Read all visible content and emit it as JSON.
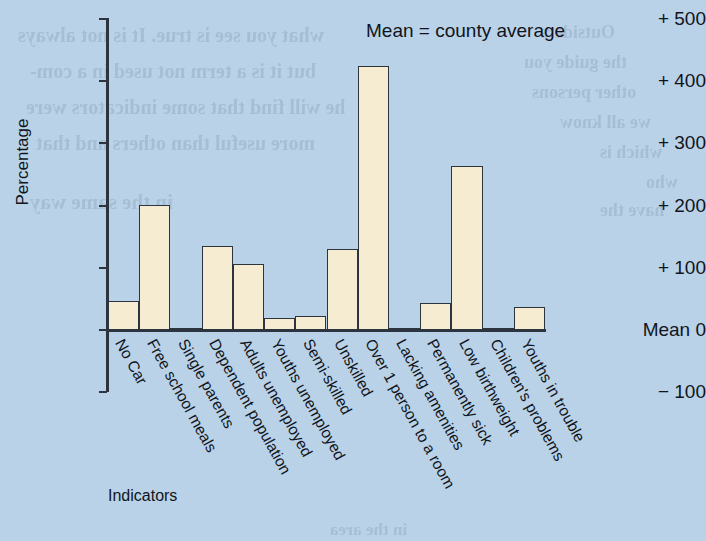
{
  "note": "Mean = county average",
  "axis": {
    "y_title": "Percentage",
    "x_title": "Indicators",
    "y_ticks": [
      "+ 500",
      "+ 400",
      "+ 300",
      "+ 200",
      "+ 100",
      "Mean 0",
      "− 100"
    ]
  },
  "colors": {
    "background": "#b9d2e8",
    "bar_fill": "#f6ecd1",
    "ink": "#2c3440"
  },
  "ghost_text": [
    "Outsiders",
    "the guide you",
    "other persons",
    "we all know",
    "which is",
    "who",
    "what you see is true. It is not always",
    "but it is a term not used in a com-",
    "he will find that some indicators were",
    "more useful than others and that",
    "in the same way",
    "These keep up the quality",
    "have the",
    "in the area"
  ],
  "chart_data": {
    "type": "bar",
    "title": "",
    "annotation": "Mean = county average",
    "xlabel": "Indicators",
    "ylabel": "Percentage",
    "ylim": [
      -100,
      500
    ],
    "yticks": [
      -100,
      0,
      100,
      200,
      300,
      400,
      500
    ],
    "ytick_labels": [
      "− 100",
      "Mean 0",
      "+ 100",
      "+ 200",
      "+ 300",
      "+ 400",
      "+ 500"
    ],
    "grid": false,
    "legend": "none",
    "baseline": 0,
    "categories": [
      "No Car",
      "Free school meals",
      "Single parents",
      "Dependent population",
      "Adults unemployed",
      "Youths unemployed",
      "Semi-skilled",
      "Unskilled",
      "Over 1 person to a room",
      "Lacking amenities",
      "Permanently sick",
      "Low birthweight",
      "Children's problems",
      "Youths in trouble"
    ],
    "values": [
      47,
      200,
      3,
      135,
      105,
      19,
      22,
      130,
      423,
      3,
      44,
      263,
      0,
      37
    ]
  }
}
